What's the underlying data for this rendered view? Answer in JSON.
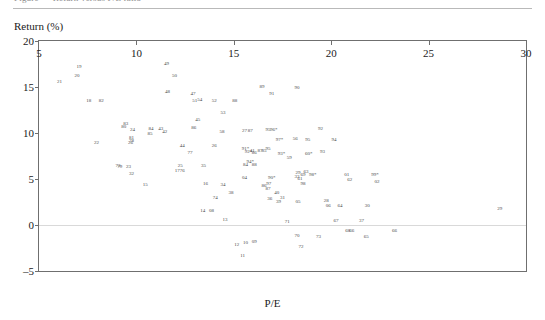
{
  "page": {
    "top_cutoff_text": "Figure — Return versus P/E ratio"
  },
  "chart_data": {
    "type": "scatter",
    "title": "",
    "xlabel": "P/E",
    "ylabel": "Return (%)",
    "xlim": [
      5,
      30
    ],
    "ylim": [
      -5,
      20
    ],
    "xticks": [
      5,
      10,
      15,
      20,
      25,
      30
    ],
    "yticks": [
      20,
      15,
      10,
      5,
      0,
      -5
    ],
    "grid": false,
    "legend": null,
    "reference_lines": [
      {
        "axis": "y",
        "value": 0,
        "color": "#d9d9d9"
      }
    ],
    "point_label_note": "Each marker is rendered as a small two-digit year code; an asterisk suffix marks flagged observations.",
    "points": [
      {
        "label": "21",
        "x": 6.05,
        "y": 15.6
      },
      {
        "label": "19",
        "x": 7.05,
        "y": 17.3
      },
      {
        "label": "20",
        "x": 6.95,
        "y": 16.3
      },
      {
        "label": "18",
        "x": 7.55,
        "y": 13.6
      },
      {
        "label": "82",
        "x": 8.2,
        "y": 13.6
      },
      {
        "label": "22",
        "x": 7.95,
        "y": 9.0
      },
      {
        "label": "83",
        "x": 9.45,
        "y": 11.1
      },
      {
        "label": "80",
        "x": 9.35,
        "y": 10.8
      },
      {
        "label": "24",
        "x": 9.8,
        "y": 10.4
      },
      {
        "label": "81",
        "x": 9.75,
        "y": 9.6
      },
      {
        "label": "84",
        "x": 10.75,
        "y": 10.5
      },
      {
        "label": "43",
        "x": 11.25,
        "y": 10.5
      },
      {
        "label": "42",
        "x": 11.45,
        "y": 10.2
      },
      {
        "label": "85",
        "x": 10.7,
        "y": 10.0
      },
      {
        "label": "78",
        "x": 9.75,
        "y": 9.2
      },
      {
        "label": "26",
        "x": 9.7,
        "y": 9.0
      },
      {
        "label": "79",
        "x": 9.15,
        "y": 6.4
      },
      {
        "label": "73",
        "x": 9.05,
        "y": 6.5
      },
      {
        "label": "23",
        "x": 9.6,
        "y": 6.4
      },
      {
        "label": "32",
        "x": 9.75,
        "y": 5.6
      },
      {
        "label": "15",
        "x": 10.45,
        "y": 4.5
      },
      {
        "label": "49",
        "x": 11.55,
        "y": 17.6
      },
      {
        "label": "50",
        "x": 11.95,
        "y": 16.3
      },
      {
        "label": "48",
        "x": 11.6,
        "y": 14.6
      },
      {
        "label": "47",
        "x": 12.9,
        "y": 14.3
      },
      {
        "label": "51",
        "x": 13.0,
        "y": 13.6
      },
      {
        "label": "54",
        "x": 13.25,
        "y": 13.7
      },
      {
        "label": "52",
        "x": 14.0,
        "y": 13.6
      },
      {
        "label": "88",
        "x": 15.05,
        "y": 13.6
      },
      {
        "label": "53",
        "x": 14.45,
        "y": 12.3
      },
      {
        "label": "45",
        "x": 13.15,
        "y": 11.5
      },
      {
        "label": "86",
        "x": 12.95,
        "y": 10.6
      },
      {
        "label": "58",
        "x": 14.4,
        "y": 10.2
      },
      {
        "label": "44",
        "x": 12.35,
        "y": 8.7
      },
      {
        "label": "26b",
        "x": 14.0,
        "y": 8.7
      },
      {
        "label": "77",
        "x": 12.75,
        "y": 7.9
      },
      {
        "label": "25",
        "x": 12.25,
        "y": 6.5
      },
      {
        "label": "35",
        "x": 13.45,
        "y": 6.5
      },
      {
        "label": "17",
        "x": 12.1,
        "y": 6.0
      },
      {
        "label": "76",
        "x": 12.35,
        "y": 6.0
      },
      {
        "label": "16",
        "x": 13.55,
        "y": 4.6
      },
      {
        "label": "34",
        "x": 14.45,
        "y": 4.5
      },
      {
        "label": "38",
        "x": 14.85,
        "y": 3.6
      },
      {
        "label": "74",
        "x": 14.05,
        "y": 3.0
      },
      {
        "label": "14",
        "x": 13.4,
        "y": 1.6
      },
      {
        "label": "08",
        "x": 13.85,
        "y": 1.6
      },
      {
        "label": "13",
        "x": 14.55,
        "y": 0.7
      },
      {
        "label": "12",
        "x": 15.15,
        "y": -2.1
      },
      {
        "label": "10",
        "x": 15.6,
        "y": -1.8
      },
      {
        "label": "09",
        "x": 16.05,
        "y": -1.7
      },
      {
        "label": "11",
        "x": 15.45,
        "y": -3.3
      },
      {
        "label": "89",
        "x": 16.45,
        "y": 15.1
      },
      {
        "label": "91",
        "x": 16.95,
        "y": 14.3
      },
      {
        "label": "90",
        "x": 18.25,
        "y": 15.0
      },
      {
        "label": "27",
        "x": 15.55,
        "y": 10.3
      },
      {
        "label": "87",
        "x": 15.85,
        "y": 10.3
      },
      {
        "label": "95",
        "x": 16.75,
        "y": 10.4
      },
      {
        "label": "96*",
        "x": 17.05,
        "y": 10.4
      },
      {
        "label": "97*",
        "x": 17.35,
        "y": 9.4
      },
      {
        "label": "56",
        "x": 18.15,
        "y": 9.5
      },
      {
        "label": "91*",
        "x": 15.6,
        "y": 8.4
      },
      {
        "label": "92*",
        "x": 15.75,
        "y": 8.0
      },
      {
        "label": "86b",
        "x": 16.05,
        "y": 7.9
      },
      {
        "label": "87b",
        "x": 16.35,
        "y": 8.2
      },
      {
        "label": "95b",
        "x": 16.75,
        "y": 8.4
      },
      {
        "label": "93*",
        "x": 17.45,
        "y": 7.8
      },
      {
        "label": "59",
        "x": 17.85,
        "y": 7.4
      },
      {
        "label": "94*",
        "x": 15.85,
        "y": 7.0
      },
      {
        "label": "04",
        "x": 15.55,
        "y": 5.2
      },
      {
        "label": "41",
        "x": 15.95,
        "y": 8.2
      },
      {
        "label": "85b",
        "x": 16.55,
        "y": 8.2
      },
      {
        "label": "84b",
        "x": 15.6,
        "y": 6.6
      },
      {
        "label": "88b",
        "x": 16.05,
        "y": 6.6
      },
      {
        "label": "90*",
        "x": 16.95,
        "y": 5.2
      },
      {
        "label": "97b",
        "x": 16.8,
        "y": 4.6
      },
      {
        "label": "86c",
        "x": 16.55,
        "y": 4.3
      },
      {
        "label": "87c",
        "x": 16.75,
        "y": 4.0
      },
      {
        "label": "40",
        "x": 17.2,
        "y": 3.6
      },
      {
        "label": "36",
        "x": 16.85,
        "y": 2.9
      },
      {
        "label": "31",
        "x": 17.5,
        "y": 3.0
      },
      {
        "label": "39",
        "x": 17.3,
        "y": 2.6
      },
      {
        "label": "05",
        "x": 18.3,
        "y": 2.6
      },
      {
        "label": "33",
        "x": 18.25,
        "y": 5.3
      },
      {
        "label": "29b",
        "x": 18.3,
        "y": 5.8
      },
      {
        "label": "61",
        "x": 18.4,
        "y": 5.1
      },
      {
        "label": "63",
        "x": 18.7,
        "y": 5.9
      },
      {
        "label": "98*",
        "x": 19.05,
        "y": 5.5
      },
      {
        "label": "69",
        "x": 18.55,
        "y": 5.5
      },
      {
        "label": "60*",
        "x": 18.85,
        "y": 7.8
      },
      {
        "label": "92",
        "x": 19.45,
        "y": 10.5
      },
      {
        "label": "93",
        "x": 19.55,
        "y": 8.0
      },
      {
        "label": "95c",
        "x": 18.8,
        "y": 9.4
      },
      {
        "label": "94b",
        "x": 20.15,
        "y": 9.4
      },
      {
        "label": "98",
        "x": 18.55,
        "y": 4.6
      },
      {
        "label": "01",
        "x": 20.8,
        "y": 5.5
      },
      {
        "label": "62",
        "x": 20.95,
        "y": 5.0
      },
      {
        "label": "99*",
        "x": 22.25,
        "y": 5.5
      },
      {
        "label": "02",
        "x": 22.35,
        "y": 4.8
      },
      {
        "label": "28",
        "x": 19.75,
        "y": 2.7
      },
      {
        "label": "06",
        "x": 19.85,
        "y": 2.2
      },
      {
        "label": "64",
        "x": 20.45,
        "y": 2.2
      },
      {
        "label": "30",
        "x": 21.85,
        "y": 2.2
      },
      {
        "label": "71",
        "x": 17.75,
        "y": 0.4
      },
      {
        "label": "70",
        "x": 18.25,
        "y": -1.1
      },
      {
        "label": "72",
        "x": 18.45,
        "y": -2.3
      },
      {
        "label": "73b",
        "x": 19.35,
        "y": -1.2
      },
      {
        "label": "67",
        "x": 20.25,
        "y": 0.5
      },
      {
        "label": "37",
        "x": 21.55,
        "y": 0.5
      },
      {
        "label": "68",
        "x": 20.85,
        "y": -0.5
      },
      {
        "label": "66",
        "x": 21.05,
        "y": -0.5
      },
      {
        "label": "65",
        "x": 21.8,
        "y": -1.2
      },
      {
        "label": "66b",
        "x": 23.25,
        "y": -0.5
      },
      {
        "label": "29",
        "x": 28.65,
        "y": 1.8
      }
    ]
  }
}
